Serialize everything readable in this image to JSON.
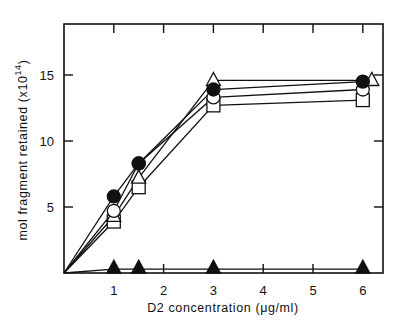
{
  "chart_data": {
    "type": "line",
    "title": "",
    "xlabel": "D2 concentration (μg/ml)",
    "ylabel": "mol fragment retained (x10",
    "ylabel_exponent": "14",
    "ylabel_suffix": ")",
    "xlim": [
      0,
      6.4
    ],
    "ylim": [
      0,
      19
    ],
    "x_ticks": [
      1,
      2,
      3,
      4,
      5,
      6
    ],
    "x_tick_labels": [
      "1",
      "2",
      "3",
      "4",
      "5",
      "6"
    ],
    "y_ticks": [
      5,
      10,
      15
    ],
    "y_tick_labels": [
      "5",
      "10",
      "15"
    ],
    "grid": false,
    "legend": "none",
    "series": [
      {
        "name": "filled-circle",
        "marker": "circle-filled",
        "x": [
          0,
          1,
          1.5,
          3,
          6
        ],
        "y": [
          0,
          5.8,
          8.3,
          13.9,
          14.5
        ]
      },
      {
        "name": "open-circle",
        "marker": "circle-open",
        "x": [
          0,
          1,
          1.5,
          3,
          6
        ],
        "y": [
          0,
          4.7,
          8.3,
          13.3,
          13.9
        ]
      },
      {
        "name": "open-triangle",
        "marker": "triangle-open",
        "x": [
          0,
          1,
          1.5,
          3,
          6
        ],
        "y": [
          0,
          4.3,
          7.2,
          14.6,
          14.6
        ]
      },
      {
        "name": "open-square",
        "marker": "square-open",
        "x": [
          0,
          1,
          1.5,
          3,
          6
        ],
        "y": [
          0,
          3.9,
          6.5,
          12.7,
          13.1
        ]
      },
      {
        "name": "filled-triangle",
        "marker": "triangle-filled",
        "x": [
          0,
          1,
          1.5,
          3,
          6
        ],
        "y": [
          0,
          0.3,
          0.3,
          0.3,
          0.3
        ]
      }
    ]
  }
}
